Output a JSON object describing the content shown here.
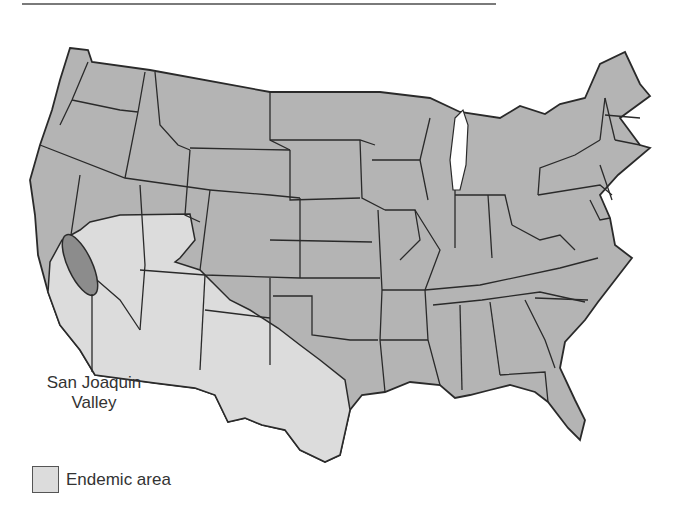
{
  "figure": {
    "type": "map",
    "region": "Contiguous United States",
    "colors": {
      "state_fill": "#b4b4b4",
      "endemic_fill": "#dcdcdc",
      "valley_fill": "#8c8c8c",
      "border": "#2a2a2a",
      "top_rule": "#7a7a7a"
    }
  },
  "annotations": {
    "valley_label_line1": "San Joaquin",
    "valley_label_line2": "Valley"
  },
  "legend": {
    "items": [
      {
        "label": "Endemic area",
        "color": "#dcdcdc"
      }
    ]
  }
}
